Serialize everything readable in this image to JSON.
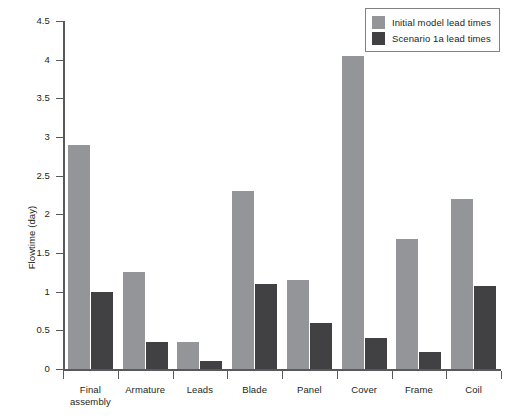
{
  "chart_data": {
    "type": "bar",
    "title": "",
    "subtitle": "",
    "xlabel": "",
    "ylabel": "Flowtime (day)",
    "ylim": [
      0,
      4.5
    ],
    "ytick_step": 0.5,
    "yticks": [
      "0",
      "0.5",
      "1",
      "1.5",
      "2",
      "2.5",
      "3",
      "3.5",
      "4",
      "4.5"
    ],
    "ytick_values": [
      0,
      0.5,
      1,
      1.5,
      2,
      2.5,
      3,
      3.5,
      4,
      4.5
    ],
    "grid": false,
    "legend_position": "top-right",
    "categories": [
      "Final assembly",
      "Armature",
      "Leads",
      "Blade",
      "Panel",
      "Cover",
      "Frame",
      "Coil"
    ],
    "series": [
      {
        "name": "Initial model lead times",
        "color": "#939598",
        "values": [
          2.9,
          1.25,
          0.35,
          2.3,
          1.15,
          4.05,
          1.68,
          2.2
        ]
      },
      {
        "name": "Scenario 1a lead times",
        "color": "#414042",
        "values": [
          1.0,
          0.35,
          0.1,
          1.1,
          0.6,
          0.4,
          0.22,
          1.07
        ]
      }
    ],
    "annotations": []
  },
  "legend": {
    "entries": [
      {
        "label": "Initial model lead times"
      },
      {
        "label": "Scenario 1a lead times"
      }
    ]
  },
  "axis": {
    "y_title": "Flowtime (day)"
  },
  "colors": {
    "series_0": "#939598",
    "series_1": "#414042",
    "axis": "#58595b",
    "text": "#231f20",
    "legend_border": "#808285",
    "background": "#ffffff"
  }
}
